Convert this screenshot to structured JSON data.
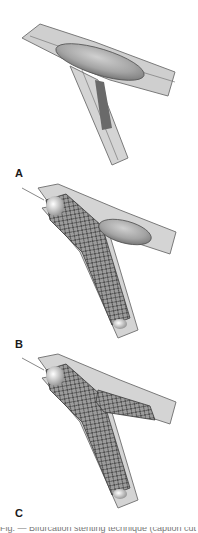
{
  "figure": {
    "panels": [
      {
        "label": "A",
        "description": "Bifurcating vessel with balloon in main branch, plaque at side-branch ostium"
      },
      {
        "label": "B",
        "description": "Mesh stent deployed from main vessel into side branch, balloon in main branch"
      },
      {
        "label": "C",
        "description": "Stents deployed in both branches (culotte/crush configuration)"
      }
    ],
    "caption_partial": "Fig. — Bifurcation stenting technique (caption cut off)"
  },
  "colors": {
    "vessel_wall": "#9a9a9a",
    "vessel_lumen": "#d6d6d6",
    "balloon": "#a8a8a8",
    "stent_mesh": "#3a3a3a",
    "label": "#1a1a1a"
  }
}
